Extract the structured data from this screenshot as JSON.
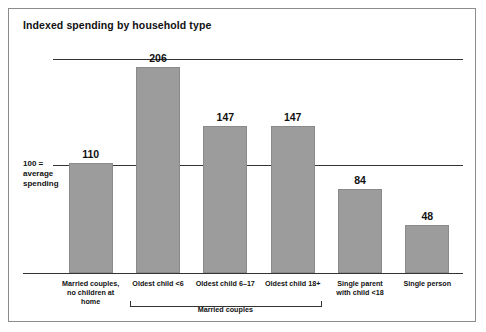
{
  "card": {
    "title": "Indexed spending by household type"
  },
  "axis": {
    "reference_label_line1": "100 =",
    "reference_label_line2": "average",
    "reference_label_line3": "spending"
  },
  "group": {
    "label": "Married couples"
  },
  "chart_data": {
    "type": "bar",
    "title": "Indexed spending by household type",
    "xlabel": "",
    "ylabel": "",
    "ylim": [
      0,
      230
    ],
    "grid": true,
    "gridlines": [
      100,
      206
    ],
    "reference_line": 100,
    "reference_line_note": "100 = average spending",
    "legend": "none",
    "bar_color": "#9c9c9c",
    "categories": [
      "Married couples,\nno children at home",
      "Oldest child <6",
      "Oldest child 6–17",
      "Oldest child 18+",
      "Single parent\nwith child <18",
      "Single person"
    ],
    "category_labels": [
      [
        "Married couples,",
        "no children at home"
      ],
      [
        "Oldest child <6"
      ],
      [
        "Oldest child 6–17"
      ],
      [
        "Oldest child 18+"
      ],
      [
        "Single parent",
        "with child <18"
      ],
      [
        "Single person"
      ]
    ],
    "values": [
      110,
      206,
      147,
      147,
      84,
      48
    ],
    "value_labels": [
      "110",
      "206",
      "147",
      "147",
      "84",
      "48"
    ],
    "groups": [
      {
        "label": "Married couples",
        "category_indices": [
          1,
          2,
          3
        ]
      }
    ]
  }
}
